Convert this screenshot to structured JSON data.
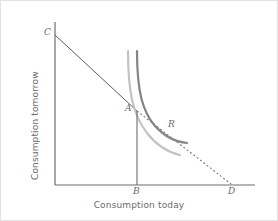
{
  "figure": {
    "name": "intertemporal-consumption-choice",
    "background": "#ffffff",
    "border_color": "#e2e2e2",
    "width": 278,
    "height": 221
  },
  "axes": {
    "x_label": "Consumption today",
    "y_label": "Consumption tomorrow",
    "axis_color": "#6e6e6e",
    "origin": {
      "x": 55,
      "y": 185
    },
    "x_end": {
      "x": 255,
      "y": 185
    },
    "y_end": {
      "x": 55,
      "y": 22
    }
  },
  "points": [
    {
      "id": "C",
      "label": "C",
      "x": 46,
      "y": 29,
      "note": "budget line intercept on vertical axis"
    },
    {
      "id": "A",
      "label": "A",
      "x": 126,
      "y": 104,
      "note": "tangency of budget line and light indifference curve"
    },
    {
      "id": "R",
      "label": "R",
      "x": 169,
      "y": 120,
      "note": "point on darker indifference curve"
    },
    {
      "id": "B",
      "label": "B",
      "x": 134,
      "y": 188,
      "note": "consumption today at A on horizontal axis"
    },
    {
      "id": "D",
      "label": "D",
      "x": 229,
      "y": 188,
      "note": "budget line intercept on horizontal axis"
    }
  ],
  "lines": {
    "budget_solid": {
      "name": "budget-line-solid",
      "color": "#5d5d5d",
      "width": 1,
      "from": {
        "x": 55,
        "y": 35
      },
      "to": {
        "x": 137,
        "y": 111
      }
    },
    "budget_dashed": {
      "name": "budget-line-dashed",
      "color": "#777777",
      "width": 1,
      "dash": "2 2",
      "from": {
        "x": 137,
        "y": 111
      },
      "to": {
        "x": 231,
        "y": 184
      }
    },
    "vertical_B": {
      "name": "vertical-line-at-B",
      "color": "#6e6e6e",
      "width": 1,
      "from": {
        "x": 137,
        "y": 111
      },
      "to": {
        "x": 137,
        "y": 185
      }
    }
  },
  "curves": [
    {
      "id": "light-indifference-curve",
      "color": "#c0c0c0",
      "width": 2,
      "path": "M128,51 C128,92 133,115 147,133 C157,146 167,152 180,155",
      "note": "lower (lighter) indifference curve passing through A"
    },
    {
      "id": "dark-indifference-curve",
      "color": "#808080",
      "width": 2,
      "path": "M137,51 C137,93 143,112 155,126 C165,137 175,142 187,143",
      "note": "higher (darker) indifference curve passing through R"
    }
  ]
}
